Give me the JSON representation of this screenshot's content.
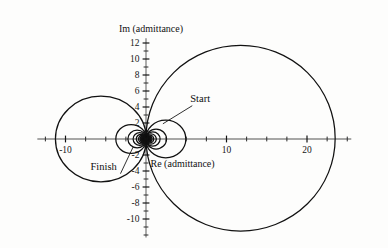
{
  "chart_data": {
    "type": "line",
    "title": "",
    "subtitle": "",
    "xlabel": "Re (admittance)",
    "ylabel": "Im (admittance)",
    "xlim": [
      -13.5,
      25.5
    ],
    "ylim": [
      -12.3,
      12.6
    ],
    "grid": false,
    "legend_position": "none",
    "x_ticks": [
      -10,
      10,
      20
    ],
    "x_tick_labels": [
      "-10",
      "10",
      "20"
    ],
    "x_minor_ticks": [
      -12.5,
      -7.5,
      -5,
      -2.5,
      2.5,
      5,
      7.5,
      12.5,
      15,
      17.5,
      22.5,
      25
    ],
    "y_ticks": [
      12,
      10,
      8,
      6,
      4,
      2,
      -2,
      -4,
      -6,
      -8,
      -10
    ],
    "y_tick_labels": [
      "12",
      "10",
      "8",
      "6",
      "4",
      "2",
      "-2",
      "-4",
      "-6",
      "-8",
      "-10"
    ],
    "y_minor_ticks": [
      11,
      9,
      7,
      5,
      3,
      1,
      -1,
      -3,
      -5,
      -7,
      -9,
      -11,
      -12
    ],
    "annotations": [
      {
        "label": "Start",
        "text_x": 5.5,
        "text_y": 4.6,
        "point_x": 2.1,
        "point_y": 1.9
      },
      {
        "label": "Finish",
        "text_x": -6.9,
        "text_y": -3.9,
        "point_x": -1.6,
        "point_y": -1.0
      }
    ],
    "series": [
      {
        "name": "resonance-loop-1",
        "shape": "circle",
        "center_x": 11.75,
        "center_y": 0.1,
        "radius_x": 11.75,
        "radius_y": 11.6
      },
      {
        "name": "resonance-loop-2",
        "shape": "circle",
        "center_x": -5.6,
        "center_y": 0.0,
        "radius_x": 5.65,
        "radius_y": 5.35
      },
      {
        "name": "resonance-loop-3",
        "shape": "circle",
        "center_x": 2.45,
        "center_y": 0.0,
        "radius_x": 2.5,
        "radius_y": 2.35
      },
      {
        "name": "resonance-loop-4",
        "shape": "circle",
        "center_x": -1.85,
        "center_y": 0.0,
        "radius_x": 1.9,
        "radius_y": 1.8
      },
      {
        "name": "resonance-loop-5",
        "shape": "circle",
        "center_x": 1.25,
        "center_y": 0.0,
        "radius_x": 1.3,
        "radius_y": 1.25
      },
      {
        "name": "resonance-loop-6",
        "shape": "circle",
        "center_x": -1.1,
        "center_y": 0.0,
        "radius_x": 1.15,
        "radius_y": 1.1
      },
      {
        "name": "resonance-loop-7",
        "shape": "circle",
        "center_x": 0.85,
        "center_y": 0.0,
        "radius_x": 0.9,
        "radius_y": 0.88
      },
      {
        "name": "resonance-loop-8",
        "shape": "circle",
        "center_x": -0.78,
        "center_y": 0.0,
        "radius_x": 0.82,
        "radius_y": 0.8
      },
      {
        "name": "resonance-loop-9",
        "shape": "circle",
        "center_x": 0.62,
        "center_y": 0.0,
        "radius_x": 0.66,
        "radius_y": 0.64
      },
      {
        "name": "resonance-loop-10",
        "shape": "circle",
        "center_x": -0.58,
        "center_y": 0.0,
        "radius_x": 0.62,
        "radius_y": 0.6
      },
      {
        "name": "resonance-loop-11",
        "shape": "circle",
        "center_x": 0.46,
        "center_y": 0.0,
        "radius_x": 0.5,
        "radius_y": 0.49
      },
      {
        "name": "resonance-loop-12",
        "shape": "circle",
        "center_x": -0.44,
        "center_y": 0.0,
        "radius_x": 0.48,
        "radius_y": 0.47
      },
      {
        "name": "resonance-loop-13",
        "shape": "circle",
        "center_x": 0.36,
        "center_y": 0.0,
        "radius_x": 0.39,
        "radius_y": 0.38
      },
      {
        "name": "resonance-loop-14",
        "shape": "circle",
        "center_x": -0.35,
        "center_y": 0.0,
        "radius_x": 0.38,
        "radius_y": 0.37
      },
      {
        "name": "resonance-loop-15",
        "shape": "circle",
        "center_x": 0.29,
        "center_y": 0.0,
        "radius_x": 0.31,
        "radius_y": 0.3
      },
      {
        "name": "resonance-loop-16",
        "shape": "circle",
        "center_x": -0.28,
        "center_y": 0.0,
        "radius_x": 0.3,
        "radius_y": 0.29
      },
      {
        "name": "resonance-loop-17",
        "shape": "circle",
        "center_x": 0.23,
        "center_y": 0.0,
        "radius_x": 0.25,
        "radius_y": 0.24
      },
      {
        "name": "resonance-loop-18",
        "shape": "circle",
        "center_x": -0.22,
        "center_y": 0.0,
        "radius_x": 0.24,
        "radius_y": 0.235
      },
      {
        "name": "resonance-loop-19",
        "shape": "circle",
        "center_x": 0.185,
        "center_y": 0.0,
        "radius_x": 0.2,
        "radius_y": 0.195
      },
      {
        "name": "resonance-loop-20",
        "shape": "circle",
        "center_x": -0.18,
        "center_y": 0.0,
        "radius_x": 0.195,
        "radius_y": 0.19
      },
      {
        "name": "resonance-loop-21",
        "shape": "circle",
        "center_x": 0.15,
        "center_y": 0.0,
        "radius_x": 0.16,
        "radius_y": 0.158
      },
      {
        "name": "resonance-loop-22",
        "shape": "circle",
        "center_x": -0.145,
        "center_y": 0.0,
        "radius_x": 0.157,
        "radius_y": 0.155
      },
      {
        "name": "resonance-loop-23",
        "shape": "circle",
        "center_x": 0.12,
        "center_y": 0.0,
        "radius_x": 0.13,
        "radius_y": 0.128
      },
      {
        "name": "resonance-loop-24",
        "shape": "circle",
        "center_x": -0.118,
        "center_y": 0.0,
        "radius_x": 0.128,
        "radius_y": 0.126
      },
      {
        "name": "resonance-loop-25",
        "shape": "circle",
        "center_x": 0.098,
        "center_y": 0.0,
        "radius_x": 0.106,
        "radius_y": 0.105
      },
      {
        "name": "resonance-loop-26",
        "shape": "circle",
        "center_x": -0.096,
        "center_y": 0.0,
        "radius_x": 0.104,
        "radius_y": 0.103
      },
      {
        "name": "resonance-loop-27",
        "shape": "circle",
        "center_x": 0.08,
        "center_y": 0.0,
        "radius_x": 0.087,
        "radius_y": 0.086
      },
      {
        "name": "resonance-loop-28",
        "shape": "circle",
        "center_x": -0.078,
        "center_y": 0.0,
        "radius_x": 0.085,
        "radius_y": 0.084
      }
    ],
    "axis_color": "#8a8a8a",
    "curve_color": "#111111",
    "text_color": "#121212"
  }
}
